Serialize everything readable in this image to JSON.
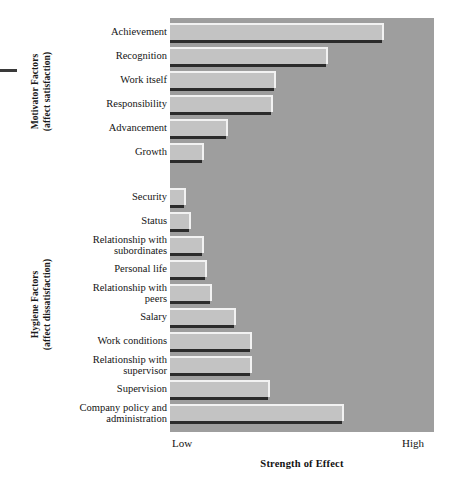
{
  "chart_data": {
    "type": "bar",
    "orientation": "horizontal",
    "title": "",
    "xlabel": "Strength of Effect",
    "ylabel": "",
    "xlim": [
      0,
      100
    ],
    "xticklabels": [
      "Low",
      "High"
    ],
    "grid": false,
    "legend": "none",
    "categories": [
      "Achievement",
      "Recognition",
      "Work itself",
      "Responsibility",
      "Advancement",
      "Growth",
      "Security",
      "Status",
      "Relationship with\nsubordinates",
      "Personal life",
      "Relationship with\npeers",
      "Salary",
      "Work conditions",
      "Relationship with\nsupervisor",
      "Supervision",
      "Company policy and\nadministration"
    ],
    "values": [
      81,
      60,
      40,
      39,
      22,
      13,
      6,
      8,
      13,
      14,
      16,
      25,
      31,
      31,
      38,
      66
    ],
    "groups": [
      {
        "name": "Motivator Factors",
        "subtitle": "(affect satisfaction)",
        "categories": [
          "Achievement",
          "Recognition",
          "Work itself",
          "Responsibility",
          "Advancement",
          "Growth"
        ]
      },
      {
        "name": "Hygiene Factors",
        "subtitle": "(affect dissatisfaction)",
        "categories": [
          "Security",
          "Status",
          "Relationship with subordinates",
          "Personal life",
          "Relationship with peers",
          "Salary",
          "Work conditions",
          "Relationship with supervisor",
          "Supervision",
          "Company policy and administration"
        ]
      }
    ],
    "colors": {
      "plot_background": "#9e9e9e",
      "bar_fill": "#c3c3c3",
      "bar_highlight": "#f2f2f2",
      "bar_shadow": "#2b2b2b",
      "page_background": "#ffffff",
      "text": "#141414"
    }
  },
  "axis": {
    "low_label": "Low",
    "high_label": "High",
    "title": "Strength of Effect"
  },
  "groups": {
    "motivator": {
      "line1": "Motivator Factors",
      "line2": "(affect satisfaction)"
    },
    "hygiene": {
      "line1": "Hygiene Factors",
      "line2": "(affect dissatisfaction)"
    }
  }
}
